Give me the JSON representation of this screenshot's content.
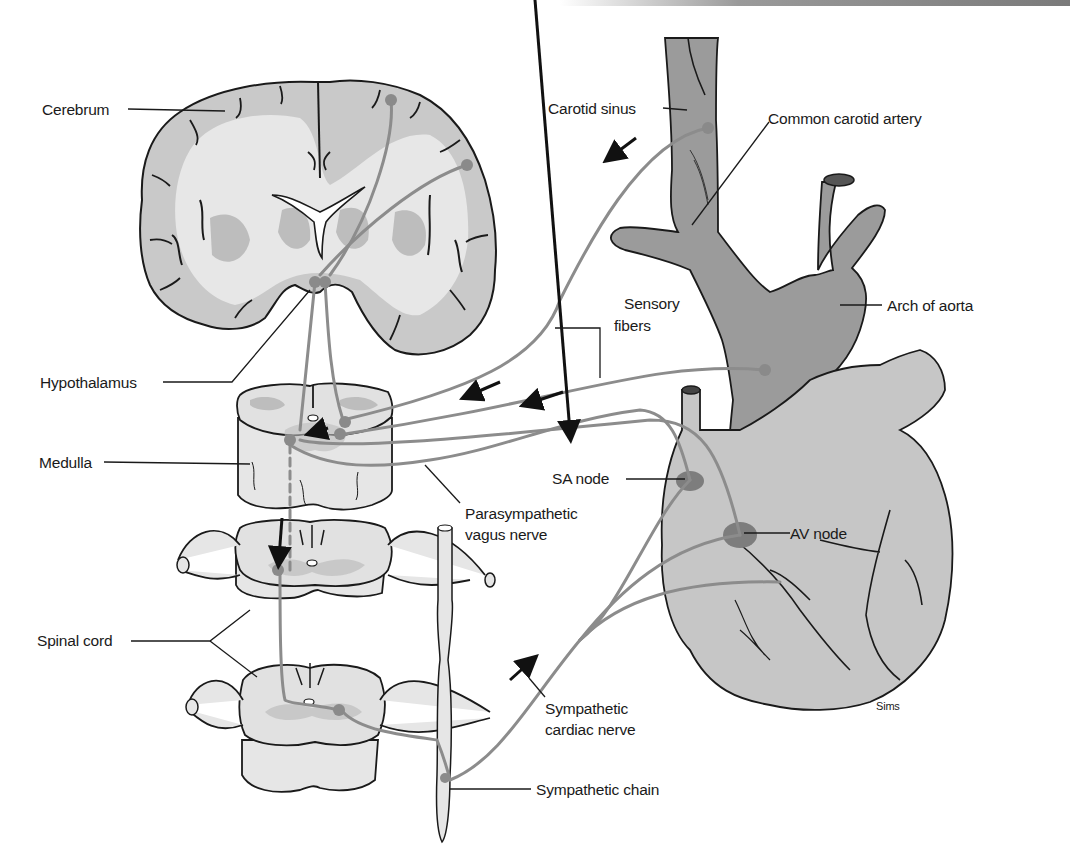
{
  "diagram": {
    "colors": {
      "vessel_fill": "#9b9b9b",
      "heart_fill": "#c4c4c4",
      "tissue_light": "#e6e6e6",
      "tissue_gray": "#bdbdbd",
      "nerve": "#8c8c8c",
      "node_fill": "#7d7d7d",
      "outline": "#1a1a1a"
    },
    "labels": {
      "cerebrum": "Cerebrum",
      "hypothalamus": "Hypothalamus",
      "medulla": "Medulla",
      "spinal_cord": "Spinal cord",
      "carotid_sinus": "Carotid sinus",
      "common_carotid_artery": "Common carotid artery",
      "arch_of_aorta": "Arch of aorta",
      "sensory_fibers_line1": "Sensory",
      "sensory_fibers_line2": "fibers",
      "sa_node": "SA node",
      "av_node": "AV node",
      "parasympathetic_line1": "Parasympathetic",
      "parasympathetic_line2": "vagus nerve",
      "sympathetic_cardiac_line1": "Sympathetic",
      "sympathetic_cardiac_line2": "cardiac nerve",
      "sympathetic_chain": "Sympathetic chain",
      "signature": "Sims"
    },
    "arrows": [
      {
        "name": "carotid-sensory-arrow",
        "direction": "toward-medulla"
      },
      {
        "name": "sensory-arrow-1",
        "direction": "toward-medulla"
      },
      {
        "name": "sensory-arrow-2",
        "direction": "toward-medulla"
      },
      {
        "name": "vagus-arrow",
        "direction": "toward-heart"
      },
      {
        "name": "medulla-internal-arrow",
        "direction": "toward-center"
      },
      {
        "name": "descending-spinal-arrow",
        "direction": "down"
      },
      {
        "name": "sympathetic-arrow",
        "direction": "toward-heart"
      }
    ]
  }
}
